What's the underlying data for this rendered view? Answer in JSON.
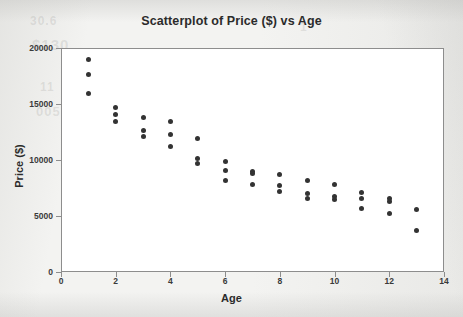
{
  "figure": {
    "background_color": "#f3f3f1",
    "plot_background_color": "#ffffff",
    "frame_color": "#8d8d8d",
    "point_color": "#333333",
    "text_color": "#2b2b2b"
  },
  "ghost_text": {
    "g1": "30.6",
    "g2": "$130",
    "g3": "11",
    "g4": "005",
    "g5": "1",
    "g6": "05",
    "g7": "1",
    "g8": "1"
  },
  "chart_data": {
    "type": "scatter",
    "title": "Scatterplot of Price ($) vs Age",
    "xlabel": "Age",
    "ylabel": "Price ($)",
    "xlim": [
      0,
      14
    ],
    "ylim": [
      0,
      20000
    ],
    "xticks": [
      0,
      2,
      4,
      6,
      8,
      10,
      12,
      14
    ],
    "xtick_labels": [
      "0",
      "2",
      "4",
      "6",
      "8",
      "10",
      "12",
      "14"
    ],
    "yticks": [
      0,
      5000,
      10000,
      15000,
      20000
    ],
    "ytick_labels": [
      "0",
      "5000",
      "10000",
      "15000",
      "20000"
    ],
    "grid": false,
    "legend": false,
    "marker": "filled-circle",
    "series": [
      {
        "name": "Price vs Age",
        "points": [
          [
            1,
            19000
          ],
          [
            1,
            17600
          ],
          [
            1,
            15900
          ],
          [
            2,
            14700
          ],
          [
            2,
            14100
          ],
          [
            2,
            13400
          ],
          [
            3,
            13800
          ],
          [
            3,
            12600
          ],
          [
            3,
            12100
          ],
          [
            4,
            13400
          ],
          [
            4,
            12300
          ],
          [
            4,
            11200
          ],
          [
            5,
            11900
          ],
          [
            5,
            10100
          ],
          [
            5,
            9700
          ],
          [
            6,
            9900
          ],
          [
            6,
            9100
          ],
          [
            6,
            8200
          ],
          [
            7,
            9000
          ],
          [
            7,
            8800
          ],
          [
            7,
            7800
          ],
          [
            8,
            8700
          ],
          [
            8,
            7700
          ],
          [
            8,
            7200
          ],
          [
            9,
            8200
          ],
          [
            9,
            7000
          ],
          [
            9,
            6600
          ],
          [
            10,
            7800
          ],
          [
            10,
            6700
          ],
          [
            10,
            6500
          ],
          [
            11,
            7100
          ],
          [
            11,
            6600
          ],
          [
            11,
            5700
          ],
          [
            12,
            6600
          ],
          [
            12,
            6300
          ],
          [
            12,
            5200
          ],
          [
            13,
            5600
          ],
          [
            13,
            3700
          ]
        ]
      }
    ]
  }
}
